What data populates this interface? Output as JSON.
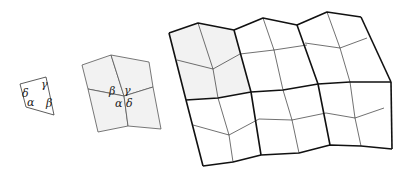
{
  "diagram": {
    "figures": [
      {
        "name": "single-quad",
        "angle_labels": {
          "alpha": "α",
          "beta": "β",
          "gamma": "γ",
          "delta": "δ"
        }
      },
      {
        "name": "four-tile-cluster",
        "angle_labels": {
          "beta": "β",
          "gamma": "γ",
          "alpha": "α",
          "delta": "δ"
        }
      },
      {
        "name": "tiling-patch",
        "rows": 2,
        "cols": 3,
        "tiles_per_block": 4
      }
    ],
    "colors": {
      "stroke": "#222222",
      "fill_shaded": "#f2f2f2",
      "background": "#ffffff"
    }
  }
}
